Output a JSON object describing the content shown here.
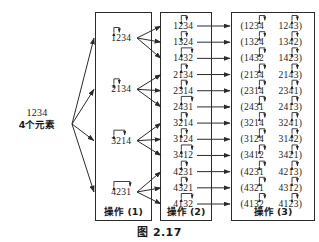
{
  "figure": {
    "caption": "图 2.17",
    "source": {
      "permutation": "1234",
      "description": "4个元素"
    },
    "colors": {
      "ink": "#1a1a1a",
      "line": "#2b2b2b",
      "background": "#ffffff"
    }
  },
  "columns": [
    {
      "id": "op1",
      "label": "操作 (1)",
      "rows": [
        {
          "value": "1234",
          "swap": [
            0,
            1
          ]
        },
        {
          "value": "2134",
          "swap": [
            0,
            1
          ]
        },
        {
          "value": "3214",
          "swap": [
            0,
            2
          ]
        },
        {
          "value": "4231",
          "swap": [
            0,
            3
          ]
        }
      ]
    },
    {
      "id": "op2",
      "label": "操作 (2)",
      "rows": [
        {
          "value": "1234",
          "swap": [
            1,
            2
          ]
        },
        {
          "value": "1324",
          "swap": [
            1,
            2
          ]
        },
        {
          "value": "1432",
          "swap": [
            1,
            3
          ]
        },
        {
          "value": "2134",
          "swap": [
            1,
            2
          ]
        },
        {
          "value": "2314",
          "swap": [
            1,
            2
          ]
        },
        {
          "value": "2431",
          "swap": [
            1,
            3
          ]
        },
        {
          "value": "3214",
          "swap": [
            1,
            2
          ]
        },
        {
          "value": "3124",
          "swap": [
            1,
            2
          ]
        },
        {
          "value": "3412",
          "swap": [
            1,
            3
          ]
        },
        {
          "value": "4231",
          "swap": [
            1,
            2
          ]
        },
        {
          "value": "4321",
          "swap": [
            1,
            2
          ]
        },
        {
          "value": "4132",
          "swap": [
            1,
            3
          ]
        }
      ]
    },
    {
      "id": "op3",
      "label": "操作 (3)",
      "rows": [
        {
          "left": "(1234",
          "right": "1243)",
          "swap": [
            2,
            3
          ]
        },
        {
          "left": "(1324",
          "right": "1342)",
          "swap": [
            2,
            3
          ]
        },
        {
          "left": "(1432",
          "right": "1423)",
          "swap": [
            2,
            3
          ]
        },
        {
          "left": "(2134",
          "right": "2143)",
          "swap": [
            2,
            3
          ]
        },
        {
          "left": "(2314",
          "right": "2341)",
          "swap": [
            2,
            3
          ]
        },
        {
          "left": "(2431",
          "right": "2413)",
          "swap": [
            2,
            3
          ]
        },
        {
          "left": "(3214",
          "right": "3241)",
          "swap": [
            2,
            3
          ]
        },
        {
          "left": "(3124",
          "right": "3142)",
          "swap": [
            2,
            3
          ]
        },
        {
          "left": "(3412",
          "right": "3421)",
          "swap": [
            2,
            3
          ]
        },
        {
          "left": "(4231",
          "right": "4213)",
          "swap": [
            2,
            3
          ]
        },
        {
          "left": "(4321",
          "right": "4312)",
          "swap": [
            2,
            3
          ]
        },
        {
          "left": "(4132",
          "right": "4123)",
          "swap": [
            2,
            3
          ]
        }
      ]
    }
  ]
}
